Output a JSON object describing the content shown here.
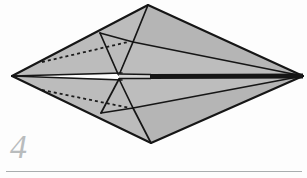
{
  "page": {
    "width": 307,
    "height": 178,
    "background_color": "#fdfdfd",
    "kind": "origami-step-diagram"
  },
  "step": {
    "number": "4",
    "label_color": "#b9bcbd",
    "label_style": "italic-serif"
  },
  "rule": {
    "color": "#a9adae",
    "x": 6,
    "y": 171,
    "width": 296
  },
  "figure": {
    "fill_color": "#b9b9b9",
    "fill_color_dark": "#a9a9a9",
    "stroke_color": "#161616",
    "spine_dark_color": "#151515",
    "spine_light_color": "#d8d8d8",
    "hidden_line_color": "#1a1a1a",
    "hidden_line_dash": "3 3",
    "vertices": {
      "left_tip": [
        12,
        76
      ],
      "right_tip": [
        303,
        76
      ],
      "top_apex": [
        148,
        5
      ],
      "bottom_apex": [
        151,
        143
      ],
      "top_inner_left": [
        100,
        33
      ],
      "top_inner_mid": [
        133,
        42
      ],
      "bottom_inner_left": [
        101,
        113
      ],
      "bottom_inner_mid": [
        133,
        108
      ],
      "spine_break": [
        150,
        77
      ]
    },
    "faces": [
      {
        "name": "upper-left-panel",
        "points": "12,76 148,5 133,42 118,74"
      },
      {
        "name": "upper-right-panel",
        "points": "148,5 303,76 133,42"
      },
      {
        "name": "upper-right-lower-panel",
        "points": "133,42 303,76 150,77 118,74"
      },
      {
        "name": "lower-left-panel",
        "points": "12,76 118,79 133,108 151,143"
      },
      {
        "name": "lower-right-panel",
        "points": "151,143 133,108 303,76"
      },
      {
        "name": "lower-right-upper-panel",
        "points": "133,108 118,79 150,78 303,76"
      }
    ],
    "fold_lines": [
      {
        "name": "outer-top-left",
        "points": "12,76 148,5"
      },
      {
        "name": "outer-top-right",
        "points": "148,5 303,76"
      },
      {
        "name": "outer-bottom-left",
        "points": "12,76 151,143"
      },
      {
        "name": "outer-bottom-right",
        "points": "151,143 303,76"
      },
      {
        "name": "crease-top-apex-to-inner",
        "points": "148,5 133,42"
      },
      {
        "name": "crease-inner-to-upper-left",
        "points": "133,42 100,33"
      },
      {
        "name": "crease-upper-left-to-spine",
        "points": "100,33 118,74"
      },
      {
        "name": "crease-inner-to-spine",
        "points": "133,42 119,75"
      },
      {
        "name": "crease-inner-to-right-tip",
        "points": "133,42 303,76"
      },
      {
        "name": "crease-bottom-apex-to-inner",
        "points": "151,143 133,108"
      },
      {
        "name": "crease-inner-to-lower-left",
        "points": "133,108 101,113"
      },
      {
        "name": "crease-lower-left-to-spine",
        "points": "101,113 119,79"
      },
      {
        "name": "crease-inner-lower-to-spine",
        "points": "133,108 119,79"
      },
      {
        "name": "crease-inner-lower-to-right-tip",
        "points": "133,108 303,76"
      },
      {
        "name": "spine-left-upper",
        "points": "12,76 120,73"
      },
      {
        "name": "spine-left-lower",
        "points": "12,76 120,80"
      }
    ],
    "hidden_lines": [
      {
        "name": "hidden-upper",
        "points": "42,62 128,42"
      },
      {
        "name": "hidden-lower",
        "points": "42,90 130,108"
      }
    ],
    "spine": {
      "light_segment": {
        "points": "119,76 150,76",
        "width": 5
      },
      "dark_segment": {
        "points": "150,77 303,76",
        "width": 5
      }
    }
  }
}
